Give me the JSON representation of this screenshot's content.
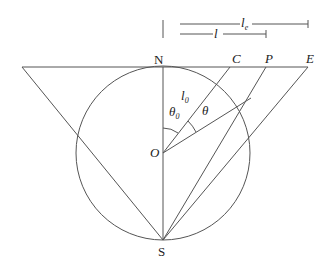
{
  "diagram": {
    "type": "geometry",
    "points": {
      "N": {
        "label": "N",
        "x": 163,
        "y": 67
      },
      "S": {
        "label": "S",
        "x": 163,
        "y": 240
      },
      "O": {
        "label": "O",
        "x": 163,
        "y": 153
      },
      "C": {
        "label": "C",
        "x": 230,
        "y": 67
      },
      "P": {
        "label": "P",
        "x": 266,
        "y": 67
      },
      "E": {
        "label": "E",
        "x": 308,
        "y": 67
      },
      "L": {
        "x": 22,
        "y": 67
      }
    },
    "labels": {
      "N": "N",
      "S": "S",
      "O": "O",
      "C": "C",
      "P": "P",
      "E": "E",
      "l": "l",
      "le_main": "l",
      "le_sub": "e",
      "l0_main": "l",
      "l0_sub": "0",
      "theta": "θ",
      "theta0_main": "θ",
      "theta0_sub": "0"
    },
    "circle": {
      "cx": 163,
      "cy": 153,
      "r": 87
    },
    "colors": {
      "stroke": "#555555",
      "text": "#222222",
      "background": "#ffffff"
    }
  }
}
